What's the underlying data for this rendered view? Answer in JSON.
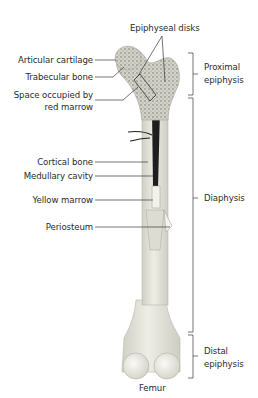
{
  "title": "Femur",
  "left_labels": [
    {
      "text": "Articular cartilage"
    },
    {
      "text": "Trabecular bone"
    },
    {
      "text": "Space occupied by"
    },
    {
      "text": "red marrow"
    },
    {
      "text": "Cortical bone"
    },
    {
      "text": "Medullary cavity"
    },
    {
      "text": "Yellow marrow"
    },
    {
      "text": "Periosteum"
    }
  ],
  "top_label": "Epiphyseal disks",
  "regions": [
    {
      "line1": "Proximal",
      "line2": "epiphysis"
    },
    {
      "line1": "Diaphysis"
    },
    {
      "line1": "Distal",
      "line2": "epiphysis"
    }
  ],
  "colors": {
    "bone": "#e6e6dc",
    "bone_shade": "#c9c9be",
    "marrow_dark": "#1e1e1e",
    "line": "#3a3a3a"
  }
}
